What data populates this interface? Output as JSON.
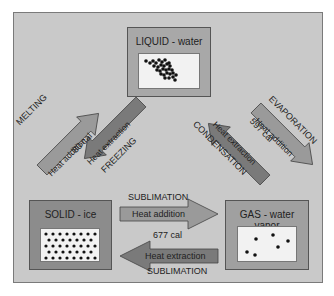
{
  "states": {
    "liquid": {
      "title": "LIQUID - water"
    },
    "solid": {
      "title": "SOLID - ice"
    },
    "gas": {
      "title": "GAS - water vapor"
    }
  },
  "transitions": {
    "melting": {
      "name": "MELTING",
      "action": "Heat addition"
    },
    "freezing": {
      "name": "FREEZING",
      "action": "Heat extraction"
    },
    "solid_liquid_energy": "80 cal",
    "evaporation": {
      "name": "EVAPORATION",
      "action": "Heat addition"
    },
    "condensation": {
      "name": "CONDENSATION",
      "action": "Heat extraction"
    },
    "liquid_gas_energy": "597 cal",
    "sublimation_forward": {
      "name": "SUBLIMATION",
      "action": "Heat addition"
    },
    "sublimation_reverse": {
      "name": "SUBLIMATION",
      "action": "Heat extraction"
    },
    "solid_gas_energy": "677 cal"
  },
  "colors": {
    "background": "#c9c9c9",
    "solid_box": "#8c8c8c",
    "liquid_box": "#a8a8a8",
    "gas_box": "#a0a0a0",
    "arrow_light": "#9a9a9a",
    "arrow_dark": "#7a7a7a"
  }
}
